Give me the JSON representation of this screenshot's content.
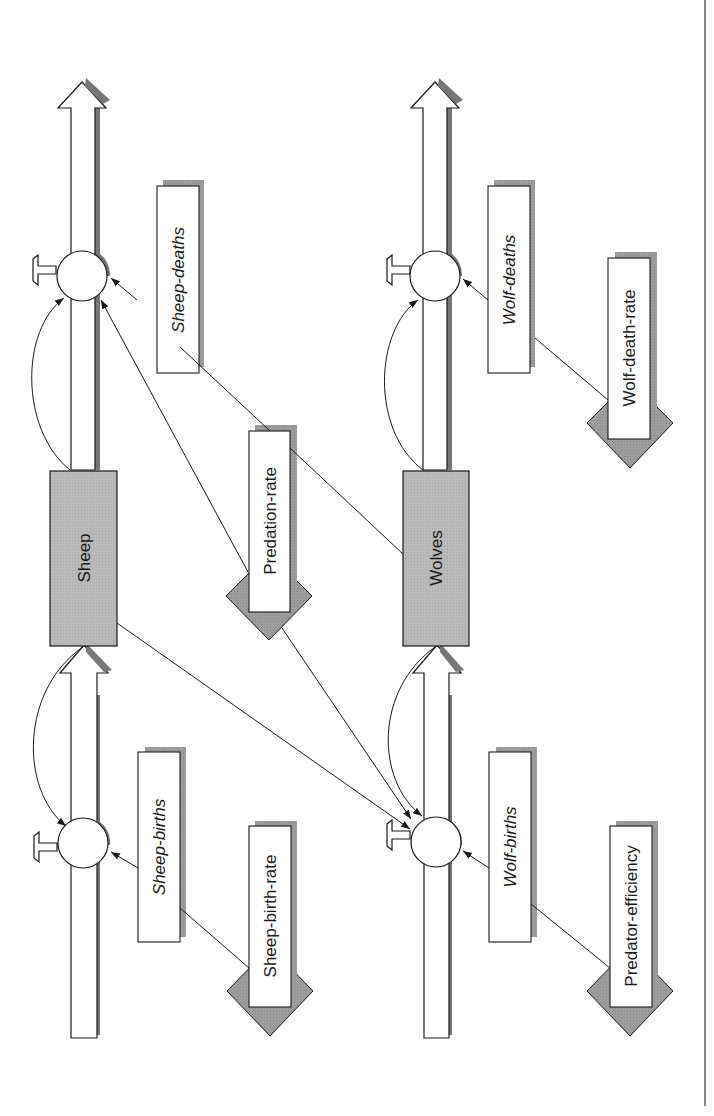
{
  "diagram": {
    "type": "stock-and-flow",
    "orientation": "rotated-90-ccw",
    "colors": {
      "stock_fill": "#b8b8b8",
      "shadow": "#808080",
      "diamond_fill": "#9a9a9a",
      "box_fill": "#ffffff",
      "line": "#1a1a1a"
    },
    "stocks": {
      "sheep": {
        "label": "Sheep"
      },
      "wolves": {
        "label": "Wolves"
      }
    },
    "flows": {
      "sheep_births": {
        "label": "Sheep-births"
      },
      "sheep_deaths": {
        "label": "Sheep-deaths"
      },
      "wolf_births": {
        "label": "Wolf-births"
      },
      "wolf_deaths": {
        "label": "Wolf-deaths"
      }
    },
    "parameters": {
      "sheep_birth_rate": {
        "label": "Sheep-birth-rate"
      },
      "predation_rate": {
        "label": "Predation-rate"
      },
      "wolf_death_rate": {
        "label": "Wolf-death-rate"
      },
      "predator_efficiency": {
        "label": "Predator-efficiency"
      }
    },
    "links": [
      {
        "from": "Sheep-birth-rate",
        "to": "Sheep-births"
      },
      {
        "from": "Sheep-births",
        "to": "sheep-births-valve"
      },
      {
        "from": "Sheep",
        "to": "sheep-births-valve"
      },
      {
        "from": "Sheep",
        "to": "sheep-deaths-valve"
      },
      {
        "from": "Sheep-deaths",
        "to": "sheep-deaths-valve"
      },
      {
        "from": "Predation-rate",
        "to": "Sheep-deaths"
      },
      {
        "from": "Predation-rate",
        "to": "sheep-deaths-valve"
      },
      {
        "from": "Predation-rate",
        "to": "Wolves"
      },
      {
        "from": "Predation-rate",
        "to": "wolf-births-valve"
      },
      {
        "from": "Sheep",
        "to": "wolf-births-valve"
      },
      {
        "from": "Wolves",
        "to": "wolf-births-valve"
      },
      {
        "from": "Wolves",
        "to": "wolf-deaths-valve"
      },
      {
        "from": "Wolf-births",
        "to": "wolf-births-valve"
      },
      {
        "from": "Predator-efficiency",
        "to": "Wolf-births"
      },
      {
        "from": "Wolf-deaths",
        "to": "wolf-deaths-valve"
      },
      {
        "from": "Wolf-death-rate",
        "to": "Wolf-deaths"
      }
    ]
  }
}
